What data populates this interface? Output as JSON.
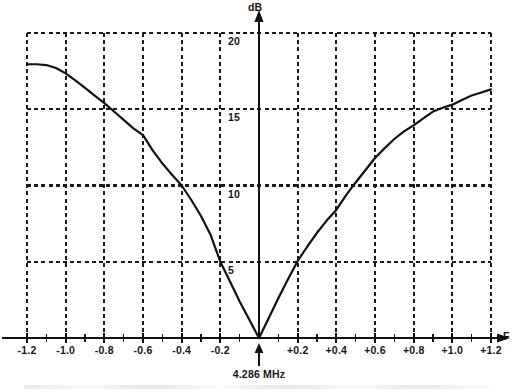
{
  "chart_data": {
    "type": "line",
    "title": "",
    "subtitle": "",
    "xlabel": "F",
    "ylabel": "dB",
    "xlim": [
      -1.2,
      1.2
    ],
    "ylim": [
      0,
      20
    ],
    "grid": true,
    "legend": null,
    "x_ticks": [
      "-1.2",
      "-1.0",
      "-0.8",
      "-0.6",
      "-0.4",
      "-0.2",
      "+0.2",
      "+0.4",
      "+0.6",
      "+0.8",
      "+1.0",
      "+1.2"
    ],
    "x_tick_values": [
      -1.2,
      -1.0,
      -0.8,
      -0.6,
      -0.4,
      -0.2,
      0.2,
      0.4,
      0.6,
      0.8,
      1.0,
      1.2
    ],
    "y_ticks": [
      "20",
      "15",
      "10",
      "5"
    ],
    "y_tick_values": [
      20,
      15,
      10,
      5
    ],
    "x_minor_tick_values": [
      -1.1,
      -0.9,
      -0.7,
      -0.5,
      -0.3,
      -0.1,
      0.1,
      0.3,
      0.5,
      0.7,
      0.9,
      1.1
    ],
    "annotations": [
      {
        "name": "center-frequency-marker",
        "text": "4.286 MHz",
        "x": 0,
        "y": 0,
        "arrow": "up"
      }
    ],
    "series": [
      {
        "name": "attenuation-response",
        "color": "#111111",
        "x": [
          -1.2,
          -1.15,
          -1.1,
          -1.05,
          -1.0,
          -0.95,
          -0.9,
          -0.85,
          -0.8,
          -0.75,
          -0.7,
          -0.65,
          -0.6,
          -0.55,
          -0.5,
          -0.45,
          -0.4,
          -0.35,
          -0.3,
          -0.25,
          -0.2,
          -0.15,
          -0.1,
          -0.05,
          0.0,
          0.05,
          0.1,
          0.15,
          0.2,
          0.25,
          0.3,
          0.35,
          0.4,
          0.45,
          0.5,
          0.55,
          0.6,
          0.65,
          0.7,
          0.75,
          0.8,
          0.85,
          0.9,
          0.95,
          1.0,
          1.05,
          1.1,
          1.15,
          1.2
        ],
        "y": [
          17.95,
          17.95,
          17.9,
          17.7,
          17.35,
          16.9,
          16.4,
          15.9,
          15.4,
          14.85,
          14.3,
          13.75,
          13.3,
          12.3,
          11.45,
          10.7,
          10.0,
          9.05,
          8.0,
          6.75,
          5.0,
          3.7,
          2.4,
          1.2,
          0.0,
          1.3,
          2.6,
          3.85,
          5.05,
          6.0,
          6.9,
          7.7,
          8.4,
          9.35,
          10.2,
          11.0,
          11.8,
          12.45,
          13.05,
          13.55,
          13.95,
          14.4,
          14.85,
          15.1,
          15.3,
          15.6,
          15.9,
          16.1,
          16.3
        ]
      }
    ]
  },
  "axes": {
    "y_axis_name": "dB",
    "x_axis_name": "F"
  },
  "marker": {
    "label": "4.286 MHz"
  },
  "colors": {
    "curve": "#111111",
    "grid": "#1a1a1a",
    "axis": "#111111",
    "background": "#ffffff"
  }
}
